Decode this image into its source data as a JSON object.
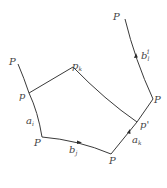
{
  "diagram": {
    "type": "geometric-figure",
    "colors": {
      "line": "#3a3a3a",
      "label": "#444444",
      "background": "#ffffff"
    },
    "labels": {
      "top_left_P": "P",
      "left_p": "p",
      "a_i": "a",
      "a_i_sub": "i",
      "bottom_left_P": "P",
      "b_j": "b",
      "b_j_sub": "j",
      "bottom_right_P": "P",
      "a_k": "a",
      "a_k_sub": "k",
      "p_prime": "p'",
      "right_P": "P",
      "b_l": "b",
      "b_l_sub": "l",
      "b_l_sup": "1",
      "top_right_P": "P",
      "p_k": "p",
      "p_k_sub": "k"
    }
  }
}
